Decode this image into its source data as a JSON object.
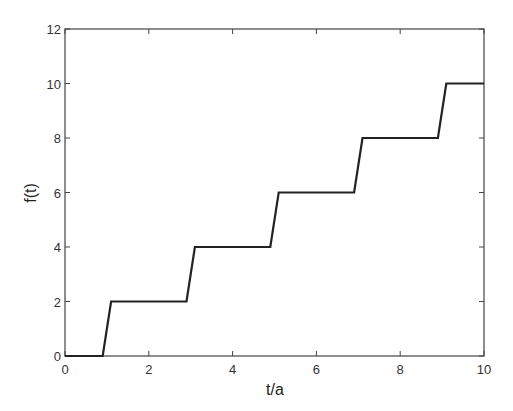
{
  "chart_data": {
    "type": "line",
    "title": "",
    "xlabel": "t/a",
    "ylabel": "f(t)",
    "xlim": [
      0,
      10
    ],
    "ylim": [
      0,
      12
    ],
    "xticks": [
      0,
      2,
      4,
      6,
      8,
      10
    ],
    "yticks": [
      0,
      2,
      4,
      6,
      8,
      10,
      12
    ],
    "grid": false,
    "legend": null,
    "series": [
      {
        "name": "f(t)",
        "color": "#222222",
        "x": [
          0,
          0.9,
          1.1,
          2.9,
          3.1,
          4.9,
          5.1,
          6.9,
          7.1,
          8.9,
          9.1,
          10
        ],
        "y": [
          0,
          0,
          2,
          2,
          4,
          4,
          6,
          6,
          8,
          8,
          10,
          10
        ]
      }
    ]
  },
  "colors": {
    "line": "#222222",
    "axes": "#444444",
    "background": "#ffffff"
  }
}
